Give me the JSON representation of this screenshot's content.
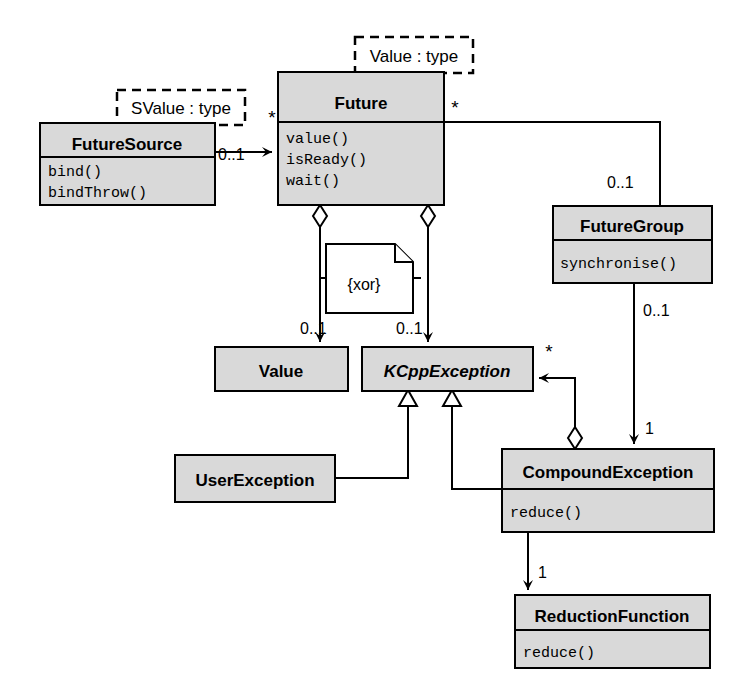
{
  "diagram": {
    "kind": "uml-class-diagram",
    "background_color": "#ffffff",
    "class_fill_color": "#d9d9d9",
    "note_fill_color": "#ffffff",
    "line_color": "#000000",
    "classes": [
      {
        "id": "future-source",
        "name": "FutureSource",
        "abstract": false,
        "members": [
          "bind()",
          "bindThrow()"
        ],
        "template_parameter": "SValue : type"
      },
      {
        "id": "future",
        "name": "Future",
        "abstract": false,
        "members": [
          "value()",
          "isReady()",
          "wait()"
        ],
        "template_parameter": "Value : type"
      },
      {
        "id": "future-group",
        "name": "FutureGroup",
        "abstract": false,
        "members": [
          "synchronise()"
        ],
        "template_parameter": ""
      },
      {
        "id": "value",
        "name": "Value",
        "abstract": false,
        "members": [],
        "template_parameter": ""
      },
      {
        "id": "kcpp-exception",
        "name": "KCppException",
        "abstract": true,
        "members": [],
        "template_parameter": ""
      },
      {
        "id": "user-exception",
        "name": "UserException",
        "abstract": false,
        "members": [],
        "template_parameter": ""
      },
      {
        "id": "compound-exception",
        "name": "CompoundException",
        "abstract": false,
        "members": [
          "reduce()"
        ],
        "template_parameter": ""
      },
      {
        "id": "reduction-function",
        "name": "ReductionFunction",
        "abstract": false,
        "members": [
          "reduce()"
        ],
        "template_parameter": ""
      }
    ],
    "notes": [
      {
        "id": "xor-note",
        "text": "{xor}"
      }
    ],
    "multiplicities": {
      "future_source_to_future_source_end": "0..1",
      "future_source_to_future_target_end": "*",
      "future_to_future_group_star": "*",
      "future_group_upper": "0..1",
      "future_group_lower": "0..1",
      "future_to_value": "0..1",
      "future_to_exception": "0..1",
      "exception_to_compound_star": "*",
      "compound_to_reduction": "1",
      "future_group_to_compound": "1"
    }
  }
}
